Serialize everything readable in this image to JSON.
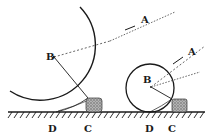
{
  "diagram": {
    "colors": {
      "ink": "#1a1a1a",
      "block": "#8a8a8a",
      "background": "#ffffff"
    },
    "large_wheel": {
      "labels": {
        "center": "B",
        "pull": "A",
        "ground_contact": "D",
        "obstacle": "C"
      }
    },
    "small_wheel": {
      "labels": {
        "center": "B",
        "pull": "A",
        "ground_contact": "D",
        "obstacle": "C"
      }
    }
  }
}
